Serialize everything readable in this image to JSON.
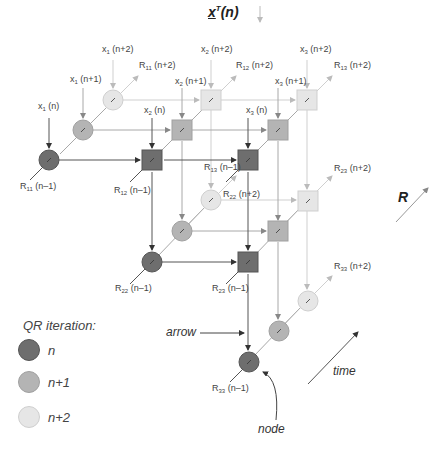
{
  "title": {
    "vector": "x",
    "superscript": "T",
    "arg": "(n)"
  },
  "axis_label_R": "R",
  "colors": {
    "n": "#6e6e6e",
    "n1": "#b0b0b0",
    "n2": "#e4e4e4",
    "line_n": "#444444",
    "line_n1": "#999999",
    "line_n2": "#cccccc"
  },
  "inputs": [
    {
      "var": "x",
      "sub": "1",
      "arg": "(n)"
    },
    {
      "var": "x",
      "sub": "1",
      "arg": "(n+1)"
    },
    {
      "var": "x",
      "sub": "1",
      "arg": "(n+2)"
    },
    {
      "var": "x",
      "sub": "2",
      "arg": "(n)"
    },
    {
      "var": "x",
      "sub": "2",
      "arg": "(n+1)"
    },
    {
      "var": "x",
      "sub": "2",
      "arg": "(n+2)"
    },
    {
      "var": "x",
      "sub": "3",
      "arg": "(n)"
    },
    {
      "var": "x",
      "sub": "3",
      "arg": "(n+1)"
    },
    {
      "var": "x",
      "sub": "3",
      "arg": "(n+2)"
    }
  ],
  "outputs_prev": [
    {
      "var": "R",
      "sub": "11",
      "arg": "(n–1)"
    },
    {
      "var": "R",
      "sub": "12",
      "arg": "(n–1)"
    },
    {
      "var": "R",
      "sub": "13",
      "arg": "(n–1)"
    },
    {
      "var": "R",
      "sub": "22",
      "arg": "(n–1)"
    },
    {
      "var": "R",
      "sub": "23",
      "arg": "(n–1)"
    },
    {
      "var": "R",
      "sub": "33",
      "arg": "(n–1)"
    }
  ],
  "outputs_next": [
    {
      "var": "R",
      "sub": "11",
      "arg": "(n+2)"
    },
    {
      "var": "R",
      "sub": "12",
      "arg": "(n+2)"
    },
    {
      "var": "R",
      "sub": "13",
      "arg": "(n+2)"
    },
    {
      "var": "R",
      "sub": "22",
      "arg": "(n+2)"
    },
    {
      "var": "R",
      "sub": "23",
      "arg": "(n+2)"
    },
    {
      "var": "R",
      "sub": "33",
      "arg": "(n+2)"
    }
  ],
  "annotations": {
    "arrow": "arrow",
    "node": "node",
    "time": "time"
  },
  "legend": {
    "title": "QR iteration:",
    "items": [
      {
        "label": "n"
      },
      {
        "label": "n+1"
      },
      {
        "label": "n+2"
      }
    ]
  }
}
